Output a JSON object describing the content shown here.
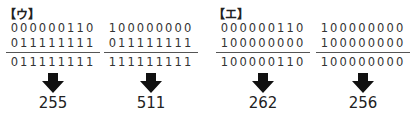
{
  "panels": [
    {
      "label": "【ウ】",
      "columns": [
        {
          "operand1": "000000110",
          "operand2": "011111111",
          "result_binary": "011111111",
          "result_decimal": "255"
        },
        {
          "operand1": "100000000",
          "operand2": "011111111",
          "result_binary": "111111111",
          "result_decimal": "511"
        }
      ]
    },
    {
      "label": "【エ】",
      "columns": [
        {
          "operand1": "000000110",
          "operand2": "100000000",
          "result_binary": "100000110",
          "result_decimal": "262"
        },
        {
          "operand1": "100000000",
          "operand2": "100000000",
          "result_binary": "100000000",
          "result_decimal": "256"
        }
      ]
    }
  ],
  "icons": {
    "arrow": "down-arrow-icon"
  },
  "colors": {
    "text": "#222222",
    "arrow": "#111111",
    "rule": "#555555"
  }
}
